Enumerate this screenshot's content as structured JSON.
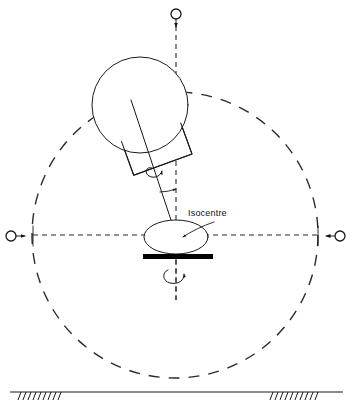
{
  "figure": {
    "type": "technical-line-diagram",
    "background_color": "#ffffff",
    "line_color": "#1a1a1a",
    "width": 353,
    "height": 412
  },
  "labels": {
    "isocentre": "Isocentre"
  },
  "icons": {
    "gantry_rotation_marker": "circle-with-down-arrow",
    "left_axis_marker": "circle-with-right-arrow",
    "right_axis_marker": "circle-with-left-arrow",
    "collimator_rotation_marker": "curved-rotation-arrow",
    "couch_rotation_marker": "curved-rotation-arrow",
    "beam_angle_marker": "angle-arc-with-arrow"
  },
  "geometry": {
    "isocentre": {
      "x": 176,
      "y": 235
    },
    "gantry_orbit_circle": {
      "cx": 175,
      "cy": 235,
      "r": 143,
      "style": "dashed"
    },
    "vertical_axis": {
      "x": 176,
      "y_top": 26,
      "y_bottom": 300,
      "style": "dashed"
    },
    "horizontal_axis": {
      "y": 235,
      "x_left": 33,
      "x_right": 318,
      "style": "dashed"
    },
    "gantry_head_circle": {
      "cx": 140,
      "cy": 105,
      "r": 48
    },
    "collimator_block": {
      "cx": 155,
      "cy": 143,
      "w": 62,
      "h": 46,
      "rotation_deg": -20
    },
    "beam_axis": {
      "x1": 131,
      "y1": 100,
      "x2": 176,
      "y2": 235,
      "angle_from_vertical_deg": 13
    },
    "patient_ellipse": {
      "cx": 176,
      "cy": 237,
      "rx": 32,
      "ry": 17
    },
    "couch_bar": {
      "x": 143,
      "y": 254,
      "w": 70,
      "h": 5
    },
    "couch_axis": {
      "x": 176,
      "y_top": 259,
      "y_bottom": 300
    },
    "floor_line": {
      "y": 392,
      "x_left": 10,
      "x_right": 343
    },
    "floor_hatch_left": {
      "x_start": 20,
      "x_end": 63,
      "count": 9
    },
    "floor_hatch_right": {
      "x_start": 272,
      "x_end": 318,
      "count": 10
    }
  },
  "markers": {
    "top_marker": {
      "cx": 176,
      "cy": 14,
      "r": 5
    },
    "left_marker": {
      "cx": 11,
      "cy": 236,
      "r": 5
    },
    "right_marker": {
      "cx": 340,
      "cy": 236,
      "r": 5
    }
  }
}
